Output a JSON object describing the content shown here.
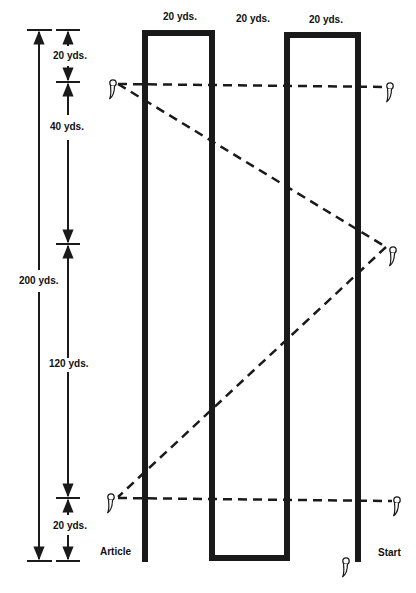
{
  "diagram": {
    "colors": {
      "line": "#1a1a1a",
      "background": "#ffffff"
    },
    "top_labels": [
      "20 yds.",
      "20 yds.",
      "20 yds."
    ],
    "vertical_dimensions": {
      "total": "200 yds.",
      "segments": [
        "20 yds.",
        "40 yds.",
        "120 yds.",
        "20 yds."
      ]
    },
    "bottom_labels": {
      "left": "Article",
      "right": "Start"
    },
    "markers": [
      {
        "name": "flag-top-left",
        "x": 113,
        "y": 86
      },
      {
        "name": "flag-top-right",
        "x": 390,
        "y": 88
      },
      {
        "name": "flag-mid-right",
        "x": 393,
        "y": 251
      },
      {
        "name": "flag-bottom-left",
        "x": 110,
        "y": 500
      },
      {
        "name": "flag-bottom-right",
        "x": 397,
        "y": 503
      },
      {
        "name": "flag-start",
        "x": 346,
        "y": 563
      }
    ]
  }
}
